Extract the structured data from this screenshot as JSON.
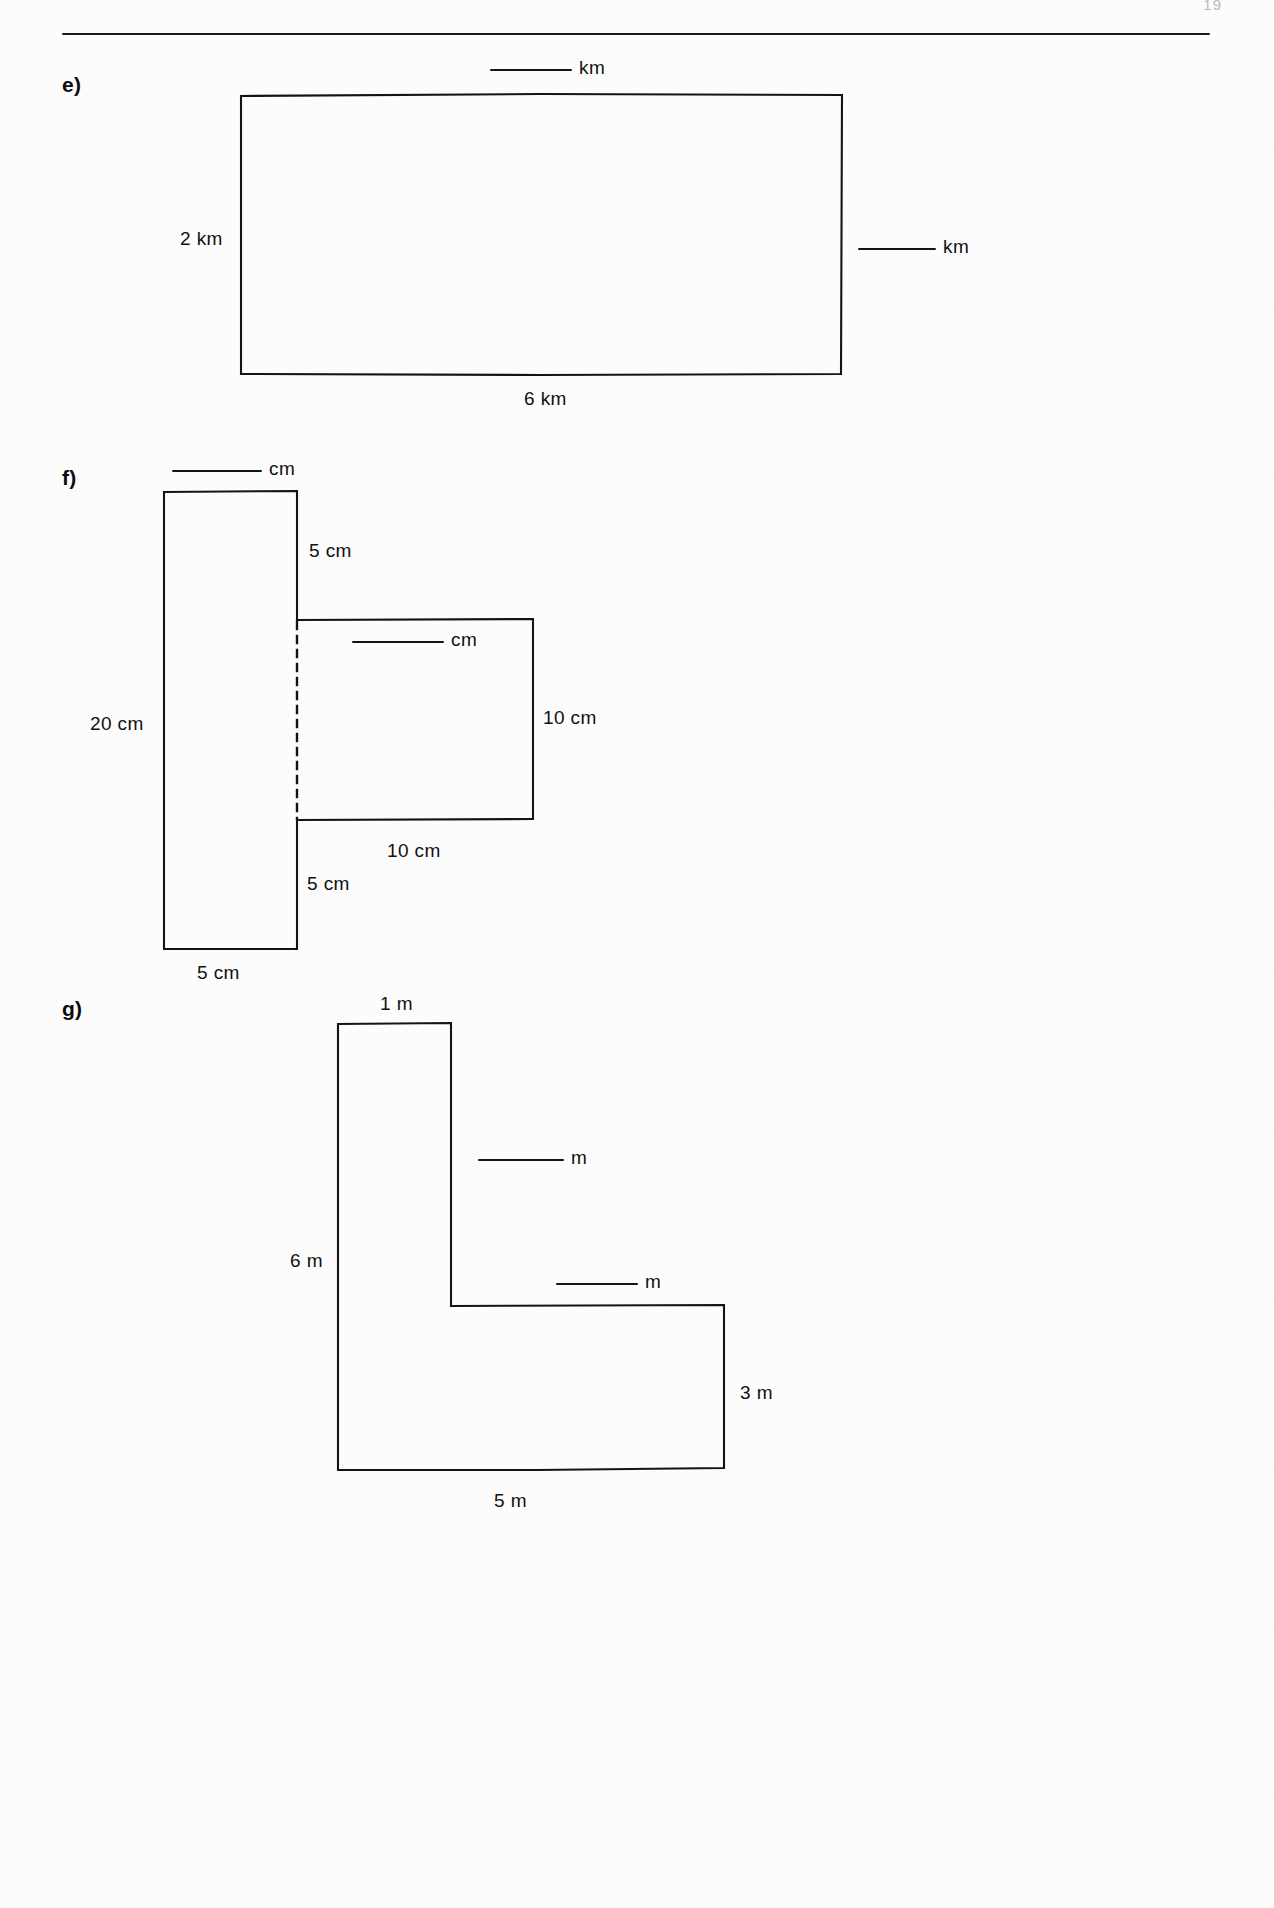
{
  "page": {
    "page_number": "19",
    "background_color": "#fcfcfc",
    "ink_color": "#141414"
  },
  "parts": [
    {
      "letter": "e)",
      "shape": "rectangle",
      "labels": {
        "top_blank_unit": "km",
        "left": "2 km",
        "right_blank_unit": "km",
        "bottom": "6 km"
      }
    },
    {
      "letter": "f)",
      "shape": "rectilinear-l-shape-with-dashed-partition",
      "labels": {
        "top_blank_unit": "cm",
        "upper_right_step": "5 cm",
        "inner_blank_unit": "cm",
        "left": "20 cm",
        "right": "10 cm",
        "inner_bottom": "10 cm",
        "lower_left_step": "5 cm",
        "bottom": "5 cm"
      }
    },
    {
      "letter": "g)",
      "shape": "l-shape",
      "labels": {
        "top": "1 m",
        "upper_blank_unit": "m",
        "lower_blank_unit": "m",
        "left": "6 m",
        "right": "3 m",
        "bottom": "5 m"
      }
    }
  ]
}
